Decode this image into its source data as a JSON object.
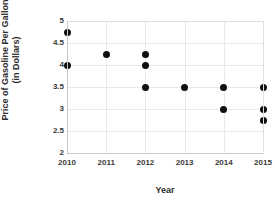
{
  "chart_data": {
    "type": "scatter",
    "title": "",
    "xlabel": "Year",
    "ylabel_line1": "Price of Gasoline Per Gallon",
    "ylabel_line2": "(in Dollars)",
    "ylabel": "Price of Gasoline Per Gallon (in Dollars)",
    "xlim": [
      2010,
      2015
    ],
    "ylim": [
      2,
      5
    ],
    "xticks": [
      "2010",
      "2011",
      "2012",
      "2013",
      "2014",
      "2015"
    ],
    "yticks": [
      "2",
      "2.5",
      "3",
      "3.5",
      "4",
      "4.5",
      "5"
    ],
    "xtick_values": [
      2010,
      2011,
      2012,
      2013,
      2014,
      2015
    ],
    "ytick_values": [
      2,
      2.5,
      3,
      3.5,
      4,
      4.5,
      5
    ],
    "grid": true,
    "legend": false,
    "marker_color": "#101010",
    "marker_shape": "circle",
    "points": [
      {
        "x": 2010,
        "y": 4.75
      },
      {
        "x": 2010,
        "y": 4.0
      },
      {
        "x": 2011,
        "y": 4.25
      },
      {
        "x": 2012,
        "y": 4.25
      },
      {
        "x": 2012,
        "y": 4.0
      },
      {
        "x": 2012,
        "y": 3.5
      },
      {
        "x": 2013,
        "y": 3.5
      },
      {
        "x": 2014,
        "y": 3.5
      },
      {
        "x": 2014,
        "y": 3.0
      },
      {
        "x": 2015,
        "y": 3.5
      },
      {
        "x": 2015,
        "y": 3.0
      },
      {
        "x": 2015,
        "y": 2.75
      }
    ]
  }
}
